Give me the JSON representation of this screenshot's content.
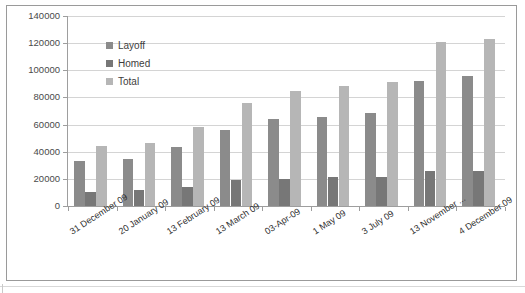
{
  "chart_data": {
    "type": "bar",
    "title": "",
    "subtitle": "",
    "xlabel": "",
    "ylabel": "",
    "ylim": [
      0,
      140000
    ],
    "ytick_step": 20000,
    "grid": true,
    "legend_position": "inside-top-left",
    "categories": [
      "31 December 09",
      "20 January 09",
      "13 February 09",
      "13 March 09",
      "03-Apr-09",
      "1 May 09",
      "3 July 09",
      "13 November ...",
      "4 December 09"
    ],
    "ytick_labels": [
      "0",
      "20000",
      "40000",
      "60000",
      "80000",
      "100000",
      "120000",
      "140000"
    ],
    "ytick_values": [
      0,
      20000,
      40000,
      60000,
      80000,
      100000,
      120000,
      140000
    ],
    "series": [
      {
        "name": "Layoff",
        "color": "#8b8b8b",
        "values": [
          33500,
          35000,
          43500,
          56000,
          64000,
          65500,
          68500,
          92000,
          95500
        ]
      },
      {
        "name": "Homed",
        "color": "#777777",
        "values": [
          10500,
          11500,
          14000,
          19000,
          20000,
          21500,
          21500,
          26000,
          26000
        ]
      },
      {
        "name": "Total",
        "color": "#b6b6b6",
        "values": [
          44500,
          46500,
          58000,
          76000,
          85000,
          88500,
          91500,
          120500,
          123000
        ]
      }
    ]
  },
  "legend": {
    "items": [
      {
        "label": "Layoff",
        "swatch_class": "layoff"
      },
      {
        "label": "Homed",
        "swatch_class": "homed"
      },
      {
        "label": "Total",
        "swatch_class": "total"
      }
    ]
  },
  "colors": {
    "layoff": "#8b8b8b",
    "homed": "#777777",
    "total": "#b6b6b6",
    "gridline": "#d4d4d4",
    "axis": "#9e9e9e",
    "frame": "#9a9a9a",
    "text": "#3d3d3d",
    "background": "#ffffff"
  }
}
